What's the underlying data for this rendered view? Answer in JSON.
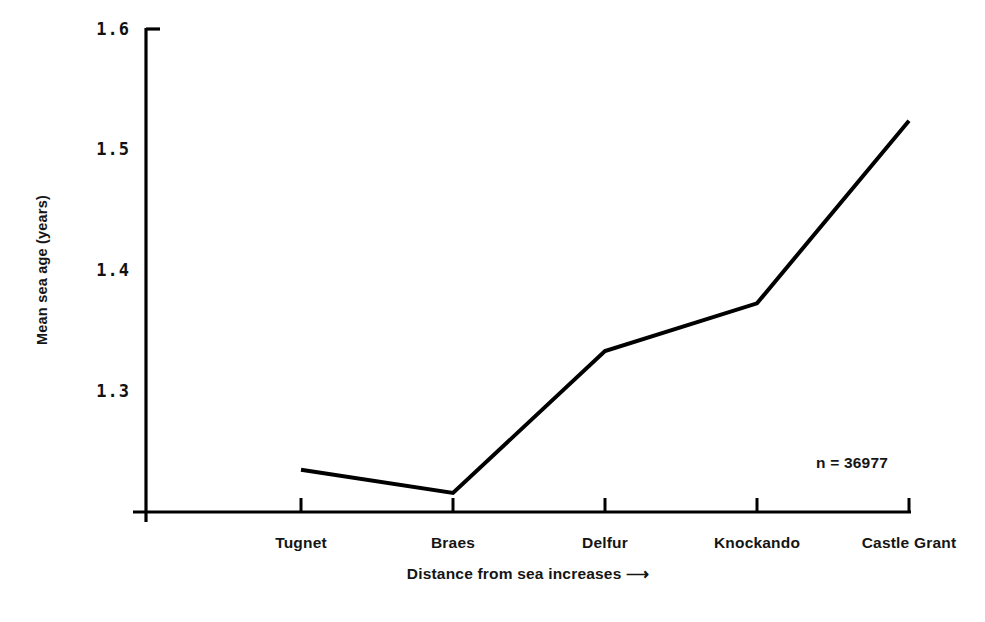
{
  "chart_data": {
    "type": "line",
    "title": "",
    "xlabel": "Distance from sea increases ⟶",
    "ylabel": "Mean sea age (years)",
    "categories": [
      "Tugnet",
      "Braes",
      "Delfur",
      "Knockando",
      "Castle Grant"
    ],
    "values": [
      1.24,
      1.221,
      1.337,
      1.376,
      1.525
    ],
    "series": [
      {
        "name": "Mean sea age",
        "values": [
          1.24,
          1.221,
          1.337,
          1.376,
          1.525
        ]
      }
    ],
    "yticks": [
      "1.3",
      "1.4",
      "1.5",
      "1.6"
    ],
    "ytick_values": [
      1.3,
      1.4,
      1.5,
      1.6
    ],
    "ylim": [
      1.2055,
      1.6
    ],
    "xlim": [
      0,
      6
    ],
    "grid": false,
    "legend": null,
    "legend_position": "none",
    "annotations": [
      {
        "name": "sample-size",
        "text": "n = 36977",
        "x": 1.248,
        "y": 4.5
      }
    ],
    "line_color": "#000000",
    "axis_color": "#000000",
    "background_color": "#ffffff",
    "markers": false
  },
  "axes": {
    "y_axis_label": "Mean sea age (years)",
    "x_axis_label": "Distance from sea increases ⟶",
    "y_tick_labels": [
      "1.6",
      "1.5",
      "1.4",
      "1.3"
    ],
    "x_tick_labels": [
      "Tugnet",
      "Braes",
      "Delfur",
      "Knockando",
      "Castle Grant"
    ]
  },
  "annotation": {
    "sample_size": "n = 36977"
  }
}
